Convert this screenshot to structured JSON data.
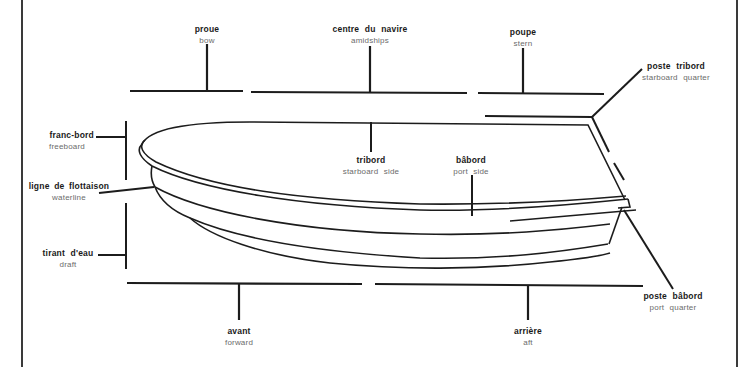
{
  "diagram": {
    "labels": [
      {
        "id": "bow",
        "fr": "proue",
        "en": "bow"
      },
      {
        "id": "amidships",
        "fr": "centre du navire",
        "en": "amidships"
      },
      {
        "id": "stern",
        "fr": "poupe",
        "en": "stern"
      },
      {
        "id": "starboard-quarter",
        "fr": "poste tribord",
        "en": "starboard quarter"
      },
      {
        "id": "freeboard",
        "fr": "franc-bord",
        "en": "freeboard"
      },
      {
        "id": "waterline",
        "fr": "ligne de flottaison",
        "en": "waterline"
      },
      {
        "id": "starboard-side",
        "fr": "tribord",
        "en": "starboard side"
      },
      {
        "id": "port-side",
        "fr": "bâbord",
        "en": "port side"
      },
      {
        "id": "draft",
        "fr": "tirant d'eau",
        "en": "draft"
      },
      {
        "id": "port-quarter",
        "fr": "poste bâbord",
        "en": "port quarter"
      },
      {
        "id": "forward",
        "fr": "avant",
        "en": "forward"
      },
      {
        "id": "aft",
        "fr": "arrière",
        "en": "aft"
      }
    ],
    "colors": {
      "line": "#1c1c1c",
      "french_text": "#1a1a1a",
      "english_text": "#6b6b6b",
      "background": "#ffffff"
    }
  }
}
